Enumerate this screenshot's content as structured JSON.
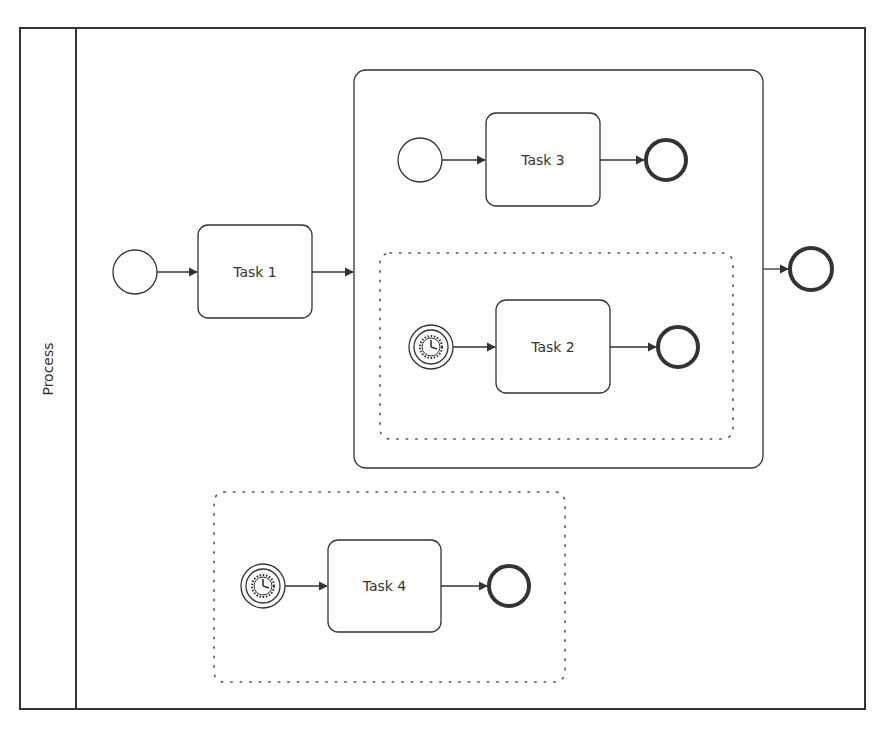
{
  "pool": {
    "label": "Process"
  },
  "tasks": [
    {
      "id": "task1",
      "label": "Task 1"
    },
    {
      "id": "task2",
      "label": "Task 2"
    },
    {
      "id": "task3",
      "label": "Task 3"
    },
    {
      "id": "task4",
      "label": "Task 4"
    }
  ],
  "elements": {
    "main_start_event": "start-event",
    "main_end_event": "end-event",
    "subprocess": "expanded-subprocess",
    "event_subprocess_inner": "event-subprocess (timer)",
    "event_subprocess_outer": "event-subprocess (timer)"
  },
  "colors": {
    "stroke": "#333333",
    "background": "#ffffff",
    "dotted": "#555555"
  }
}
